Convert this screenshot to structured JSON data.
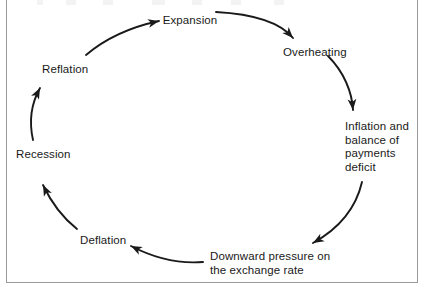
{
  "figure": {
    "kind": "cycle-diagram",
    "direction": "clockwise",
    "width": 424,
    "height": 293,
    "background": "#ffffff",
    "ink": "#1a1a1a",
    "frame_color": "#9a9a9a"
  },
  "nodes": [
    {
      "id": "expansion",
      "label": "Expansion",
      "x": 190,
      "y": 14,
      "align": "center"
    },
    {
      "id": "overheating",
      "label": "Overheating",
      "x": 283,
      "y": 46,
      "align": "left"
    },
    {
      "id": "inflation",
      "label": "Inflation and\nbalance of\npayments\ndeficit",
      "x": 345,
      "y": 120,
      "align": "left"
    },
    {
      "id": "downward",
      "label": "Downward pressure on\nthe exchange rate",
      "x": 210,
      "y": 250,
      "align": "left"
    },
    {
      "id": "deflation",
      "label": "Deflation",
      "x": 80,
      "y": 234,
      "align": "left"
    },
    {
      "id": "recession",
      "label": "Recession",
      "x": 16,
      "y": 148,
      "align": "left"
    },
    {
      "id": "reflation",
      "label": "Reflation",
      "x": 42,
      "y": 63,
      "align": "left"
    }
  ],
  "arrows": [
    {
      "id": "reflation-to-expansion",
      "from": "reflation",
      "to": "expansion",
      "path": "M 86 55 C 106 38, 131 27, 159 21",
      "head_angle": 348
    },
    {
      "id": "expansion-to-overheating",
      "from": "expansion",
      "to": "overheating",
      "path": "M 216 12 C 252 14, 280 22, 293 38",
      "head_angle": 52
    },
    {
      "id": "overheating-to-inflation",
      "from": "overheating",
      "to": "inflation",
      "path": "M 328 56 C 344 72, 352 92, 353 110",
      "head_angle": 85
    },
    {
      "id": "inflation-to-downward",
      "from": "inflation",
      "to": "downward",
      "path": "M 362 182 C 356 208, 340 228, 313 243",
      "head_angle": 152
    },
    {
      "id": "downward-to-deflation",
      "from": "downward",
      "to": "deflation",
      "path": "M 203 262 C 178 264, 154 258, 131 246",
      "head_angle": 206
    },
    {
      "id": "deflation-to-recession",
      "from": "deflation",
      "to": "recession",
      "path": "M 77 229 C 63 218, 52 204, 43 185",
      "head_angle": 245
    },
    {
      "id": "recession-to-reflation",
      "from": "recession",
      "to": "reflation",
      "path": "M 33 140 C 29 122, 31 104, 40 88",
      "head_angle": 298
    }
  ]
}
